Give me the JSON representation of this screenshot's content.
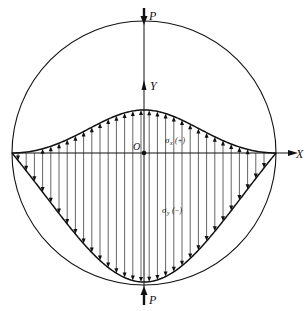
{
  "diagram": {
    "labels": {
      "load_top": "P",
      "load_bottom": "P",
      "y_axis": "Y",
      "x_axis": "X",
      "origin": "O",
      "sigma_x": "σ",
      "sigma_x_sub": "x",
      "sigma_x_sign": "(+)",
      "sigma_y": "σ",
      "sigma_y_sub": "y",
      "sigma_y_sign": "(−)"
    },
    "colors": {
      "stroke": "#111111",
      "background": "#ffffff"
    },
    "geometry": {
      "circle_center": [
        144,
        153
      ],
      "circle_radius": 132,
      "axis_y": 153,
      "sigma_x_peak_y": 110,
      "sigma_y_min_y": 282
    },
    "distributions": [
      {
        "name": "sigma_x",
        "sign": "+",
        "description": "tensile, arrows pointing up, bell-shaped curve above X axis"
      },
      {
        "name": "sigma_y",
        "sign": "-",
        "description": "compressive, arrows pointing down, deep curve below X axis reaching bottom of circle"
      }
    ]
  }
}
